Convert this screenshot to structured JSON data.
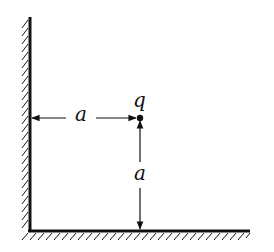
{
  "diagram": {
    "charge_label": "q",
    "horizontal_distance_label": "a",
    "vertical_distance_label": "a",
    "colors": {
      "ink": "#111111",
      "background": "#ffffff"
    }
  }
}
